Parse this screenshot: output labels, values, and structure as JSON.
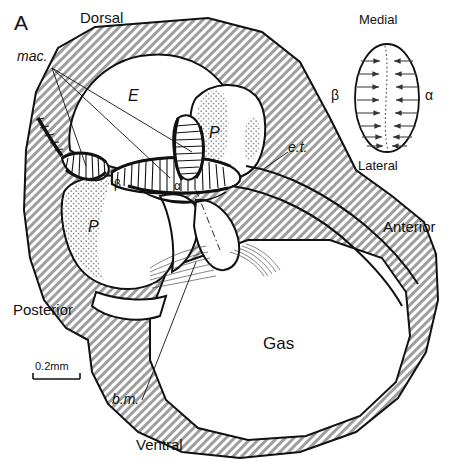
{
  "figure": {
    "panel_letter": "A",
    "scale_bar": {
      "label": "0.2mm"
    }
  },
  "orientation_labels": {
    "dorsal": "Dorsal",
    "ventral": "Ventral",
    "anterior": "Anterior",
    "posterior": "Posterior"
  },
  "structure_labels": {
    "macula": "mac.",
    "eustachian_tube": "e.t.",
    "basilar_membrane": "b.m.",
    "gas": "Gas",
    "epithelium": "E",
    "perilymph_upper": "P",
    "perilymph_lower": "P",
    "beta": "β",
    "alpha": "α"
  },
  "inset": {
    "medial": "Medial",
    "lateral": "Lateral",
    "beta": "β",
    "alpha": "α",
    "arrow_pairs": 8,
    "description": "ellipse with opposing hair-cell orientation arrows meeting at a dotted reversal line"
  },
  "colors": {
    "ink": "#111111",
    "hatch": "#9a9a9a",
    "stipple": "#b4b4b4",
    "background": "#ffffff"
  }
}
